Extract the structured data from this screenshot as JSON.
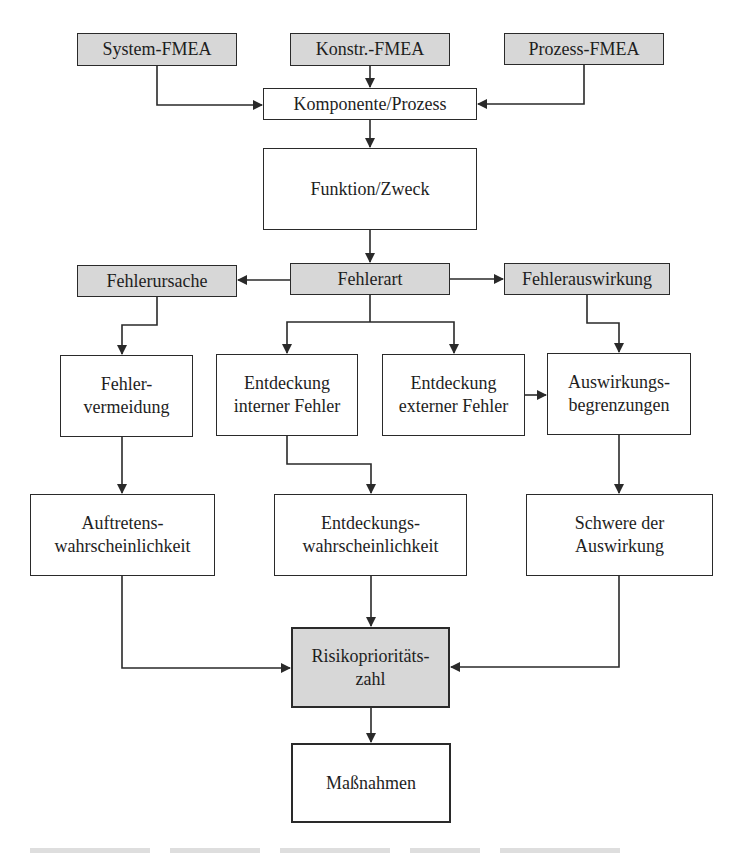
{
  "diagram": {
    "type": "flowchart",
    "colors": {
      "highlight_fill": "#d7d7d7",
      "plain_fill": "#ffffff",
      "stroke": "#2a2a2a",
      "text": "#1e1e1e"
    },
    "nodes": {
      "system_fmea": {
        "label": "System-FMEA",
        "style": "gray"
      },
      "konstr_fmea": {
        "label": "Konstr.-FMEA",
        "style": "gray"
      },
      "prozess_fmea": {
        "label": "Prozess-FMEA",
        "style": "gray"
      },
      "komponente_prozess": {
        "label": "Komponente/Prozess",
        "style": "plain"
      },
      "funktion_zweck": {
        "label": "Funktion/Zweck",
        "style": "plain"
      },
      "fehlerursache": {
        "label": "Fehlerursache",
        "style": "gray"
      },
      "fehlerart": {
        "label": "Fehlerart",
        "style": "gray"
      },
      "fehlerauswirkung": {
        "label": "Fehlerauswirkung",
        "style": "gray"
      },
      "fehlervermeidung": {
        "label": "Fehler-\nvermeidung",
        "style": "plain"
      },
      "entdeckung_intern": {
        "label": "Entdeckung\ninterner Fehler",
        "style": "plain"
      },
      "entdeckung_extern": {
        "label": "Entdeckung\nexterner Fehler",
        "style": "plain"
      },
      "auswirkungsbegrenzungen": {
        "label": "Auswirkungs-\nbegrenzungen",
        "style": "plain"
      },
      "auftretenswahrscheinlichkeit": {
        "label": "Auftretens-\nwahrscheinlichkeit",
        "style": "plain"
      },
      "entdeckungswahrscheinlichkeit": {
        "label": "Entdeckungs-\nwahrscheinlichkeit",
        "style": "plain"
      },
      "schwere_der_auswirkung": {
        "label": "Schwere der\nAuswirkung",
        "style": "plain"
      },
      "risikoprioritaetszahl": {
        "label": "Risikoprioritäts-\nzahl",
        "style": "gray-thick"
      },
      "massnahmen": {
        "label": "Maßnahmen",
        "style": "plain-thick"
      }
    },
    "edges": [
      {
        "from": "system_fmea",
        "to": "komponente_prozess"
      },
      {
        "from": "konstr_fmea",
        "to": "komponente_prozess"
      },
      {
        "from": "prozess_fmea",
        "to": "komponente_prozess"
      },
      {
        "from": "komponente_prozess",
        "to": "funktion_zweck"
      },
      {
        "from": "funktion_zweck",
        "to": "fehlerart"
      },
      {
        "from": "fehlerart",
        "to": "fehlerursache"
      },
      {
        "from": "fehlerart",
        "to": "fehlerauswirkung"
      },
      {
        "from": "fehlerursache",
        "to": "fehlervermeidung"
      },
      {
        "from": "fehlerart",
        "to": "entdeckung_intern"
      },
      {
        "from": "fehlerart",
        "to": "entdeckung_extern"
      },
      {
        "from": "fehlerauswirkung",
        "to": "auswirkungsbegrenzungen"
      },
      {
        "from": "entdeckung_extern",
        "to": "auswirkungsbegrenzungen"
      },
      {
        "from": "fehlervermeidung",
        "to": "auftretenswahrscheinlichkeit"
      },
      {
        "from": "entdeckung_intern",
        "to": "entdeckungswahrscheinlichkeit"
      },
      {
        "from": "auswirkungsbegrenzungen",
        "to": "schwere_der_auswirkung"
      },
      {
        "from": "auftretenswahrscheinlichkeit",
        "to": "risikoprioritaetszahl"
      },
      {
        "from": "entdeckungswahrscheinlichkeit",
        "to": "risikoprioritaetszahl"
      },
      {
        "from": "schwere_der_auswirkung",
        "to": "risikoprioritaetszahl"
      },
      {
        "from": "risikoprioritaetszahl",
        "to": "massnahmen"
      }
    ]
  }
}
